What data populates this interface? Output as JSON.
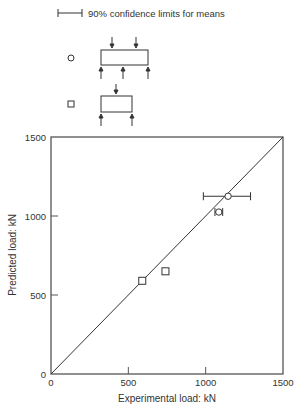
{
  "legend": {
    "errorbar_label": "90% confidence limits for means",
    "series": [
      {
        "marker": "circle",
        "description": "beam with two point loads and three supports"
      },
      {
        "marker": "square",
        "description": "beam with one point load and two supports"
      }
    ]
  },
  "chart_data": {
    "type": "scatter",
    "title": "",
    "xlabel": "Experimental load: kN",
    "ylabel": "Predicted load: kN",
    "xlim": [
      0,
      1500
    ],
    "ylim": [
      0,
      1500
    ],
    "xticks": [
      "0",
      "500",
      "1000",
      "1500"
    ],
    "yticks": [
      "0",
      "500",
      "1000",
      "1500"
    ],
    "grid": false,
    "reference_line": {
      "label": "y = x",
      "from": [
        0,
        0
      ],
      "to": [
        1500,
        1500
      ]
    },
    "series": [
      {
        "name": "circle",
        "marker": "circle",
        "points": [
          {
            "x": 1145,
            "y": 1125,
            "xerr": [
              985,
              1290
            ]
          },
          {
            "x": 1085,
            "y": 1025,
            "xerr": [
              1060,
              1110
            ]
          }
        ]
      },
      {
        "name": "square",
        "marker": "square",
        "points": [
          {
            "x": 590,
            "y": 590
          },
          {
            "x": 740,
            "y": 650
          }
        ]
      }
    ]
  }
}
